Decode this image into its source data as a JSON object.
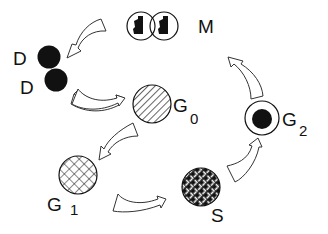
{
  "diagram": {
    "type": "cell-cycle",
    "colors": {
      "ink": "#111111",
      "background": "#ffffff"
    },
    "stages": [
      {
        "id": "M",
        "label": "M",
        "subscript": "",
        "fill": "two-overlapping-circles-with-chromosomes"
      },
      {
        "id": "D1",
        "label": "D",
        "subscript": "",
        "fill": "solid-black"
      },
      {
        "id": "D2",
        "label": "D",
        "subscript": "",
        "fill": "solid-black"
      },
      {
        "id": "G0",
        "label": "G",
        "subscript": "0",
        "fill": "diagonal-hatch"
      },
      {
        "id": "G1",
        "label": "G",
        "subscript": "1",
        "fill": "crosshatch"
      },
      {
        "id": "S",
        "label": "S",
        "subscript": "",
        "fill": "woven-crosshatch"
      },
      {
        "id": "G2",
        "label": "G",
        "subscript": "2",
        "fill": "ring-with-black-nucleus"
      }
    ],
    "arrows": [
      {
        "from": "M",
        "to": "D",
        "icon": "curved-arrow-icon"
      },
      {
        "from": "D",
        "to": "G0",
        "icon": "curved-arrow-icon"
      },
      {
        "from": "G0",
        "to": "G1",
        "icon": "curved-arrow-icon"
      },
      {
        "from": "G1",
        "to": "S",
        "icon": "curved-arrow-icon"
      },
      {
        "from": "S",
        "to": "G2",
        "icon": "curved-arrow-icon"
      },
      {
        "from": "G2",
        "to": "M",
        "icon": "curved-arrow-icon"
      }
    ]
  }
}
